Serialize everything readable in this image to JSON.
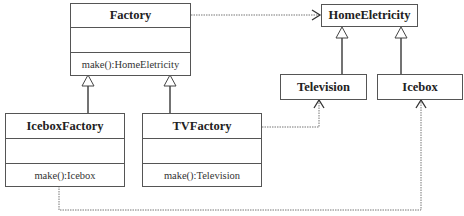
{
  "diagram": {
    "type": "uml-class-diagram",
    "classes": {
      "factory": {
        "name": "Factory",
        "operation": "make():HomeEletricity"
      },
      "icebox_factory": {
        "name": "IceboxFactory",
        "operation": "make():Icebox"
      },
      "tv_factory": {
        "name": "TVFactory",
        "operation": "make():Television"
      },
      "home_eletricity": {
        "name": "HomeEletricity"
      },
      "television": {
        "name": "Television"
      },
      "icebox": {
        "name": "Icebox"
      }
    },
    "relations": [
      {
        "from": "IceboxFactory",
        "to": "Factory",
        "kind": "generalization"
      },
      {
        "from": "TVFactory",
        "to": "Factory",
        "kind": "generalization"
      },
      {
        "from": "Television",
        "to": "HomeEletricity",
        "kind": "generalization"
      },
      {
        "from": "Icebox",
        "to": "HomeEletricity",
        "kind": "generalization"
      },
      {
        "from": "Factory",
        "to": "HomeEletricity",
        "kind": "dependency"
      },
      {
        "from": "TVFactory",
        "to": "Television",
        "kind": "dependency"
      },
      {
        "from": "IceboxFactory",
        "to": "Icebox",
        "kind": "dependency"
      }
    ],
    "colors": {
      "line": "#555555",
      "dotted": "#777777",
      "background": "#ffffff"
    }
  }
}
